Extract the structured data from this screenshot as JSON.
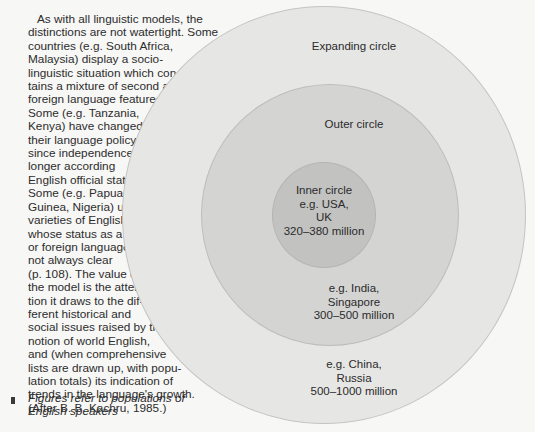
{
  "text_block": {
    "lines": [
      "As with all linguistic models, the",
      "distinctions are not watertight. Some",
      "countries (e.g. South Africa,",
      "Malaysia) display a socio-",
      "linguistic situation which con-",
      "tains a mixture of second and",
      "foreign language features.",
      "Some (e.g. Tanzania,",
      "Kenya) have changed",
      "their language policy",
      "since independence, no",
      "longer according",
      "English official status.",
      "Some (e.g. Papua New",
      "Guinea, Nigeria) use",
      "varieties of English",
      "whose status as a first",
      "or foreign language is",
      "not always clear",
      "(p. 108). The value of",
      "the model is the atten-",
      "tion it draws to the dif-",
      "ferent historical and",
      "social issues raised by the",
      "notion of world English,",
      "and (when comprehensive",
      "lists are drawn up, with popu-",
      "lation totals) its indication of",
      "trends in the language's growth.",
      "(After B. B. Kachru, 1985.)"
    ]
  },
  "caption": {
    "lines": [
      "Figures refer to populations of",
      "English speakers"
    ]
  },
  "diagram": {
    "expanding_circle": {
      "title": "Expanding circle",
      "examples_line1": "e.g. China,",
      "examples_line2": "Russia",
      "population": "500–1000 million",
      "fill": "#e6e6e5"
    },
    "outer_circle": {
      "title": "Outer circle",
      "examples_line1": "e.g. India,",
      "examples_line2": "Singapore",
      "population": "300–500 million",
      "fill": "#d4d4d3"
    },
    "inner_circle": {
      "title": "Inner circle",
      "examples_line1": "e.g. USA,",
      "examples_line2": "UK",
      "population": "320–380 million",
      "fill": "#c2c2c1"
    }
  }
}
